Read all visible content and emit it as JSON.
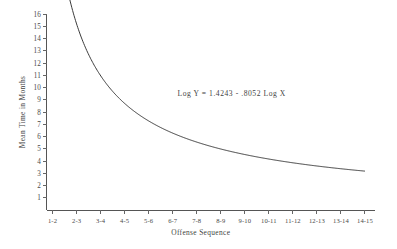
{
  "chart_data": {
    "type": "line",
    "title": "",
    "xlabel": "Offense Sequence",
    "ylabel": "Mean Time in Months",
    "categories": [
      "1-2",
      "2-3",
      "3-4",
      "4-5",
      "5-6",
      "6-7",
      "7-8",
      "8-9",
      "9-10",
      "10-11",
      "11-12",
      "12-13",
      "13-14",
      "14-15"
    ],
    "x": [
      1,
      2,
      3,
      4,
      5,
      6,
      7,
      8,
      9,
      10,
      11,
      12,
      13,
      14
    ],
    "values": [
      15.4,
      10.8,
      8.3,
      6.9,
      5.9,
      5.2,
      4.7,
      4.3,
      4.0,
      3.7,
      3.5,
      3.3,
      3.1,
      3.0
    ],
    "series": [
      {
        "name": "Fitted power curve",
        "values": [
          15.4,
          10.8,
          8.3,
          6.9,
          5.9,
          5.2,
          4.7,
          4.3,
          4.0,
          3.7,
          3.5,
          3.3,
          3.1,
          3.0
        ]
      }
    ],
    "ylim": [
      0,
      16
    ],
    "xlim": [
      0.75,
      14.25
    ],
    "yticks": [
      1,
      2,
      3,
      4,
      5,
      6,
      7,
      8,
      9,
      10,
      11,
      12,
      13,
      14,
      15,
      16
    ],
    "ytick_labels": [
      "1",
      "2",
      "3",
      "4",
      "5",
      "6",
      "7",
      "8",
      "9",
      "10",
      "11",
      "12",
      "13",
      "14",
      "15",
      "16"
    ],
    "grid": false,
    "legend": "none",
    "annotations": [
      {
        "name": "regression-equation",
        "text": "Log Y = 1.4243 - .8052 Log X",
        "x": 6.2,
        "y": 9.3
      }
    ],
    "equation": {
      "intercept": 1.4243,
      "slope": -0.8052,
      "form": "Log Y = 1.4243 - .8052 Log X"
    },
    "colors": {
      "curve": "#3b3b3b",
      "axis": "#555555",
      "text": "#3f3f3f",
      "background": "#ffffff"
    }
  }
}
